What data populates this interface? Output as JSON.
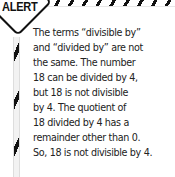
{
  "badge": {
    "label": "ALERT",
    "icon": "alert-diamond-icon"
  },
  "body": {
    "lines": [
      "The terms “divisible by”",
      "and “divided by” are not",
      "the same. The number",
      "18 can be divided by 4,",
      "but 18 is not divisible",
      "by 4. The quotient of",
      "18 divided by 4 has a",
      "remainder other than 0.",
      "So, 18 is not divisible by 4."
    ]
  },
  "colors": {
    "stripe_dark": "#111111",
    "text": "#222222",
    "background": "#ffffff"
  }
}
